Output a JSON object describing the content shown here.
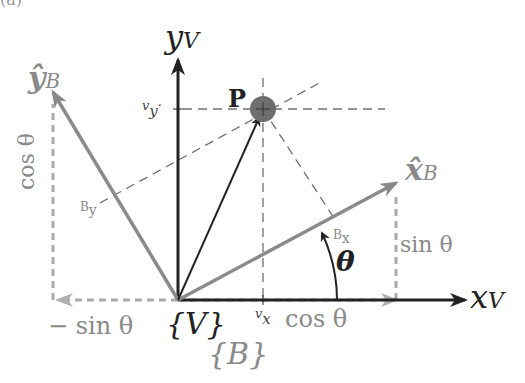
{
  "figure": {
    "panel_label": "(a)",
    "frames": {
      "world": {
        "name": "{V}",
        "x_axis": "x",
        "x_sub": "V",
        "y_axis": "y",
        "y_sub": "V"
      },
      "body": {
        "name": "{B}",
        "x_axis": "x̂",
        "x_sub": "B",
        "y_axis": "ŷ",
        "y_sub": "B"
      }
    },
    "point": {
      "label": "P"
    },
    "angle": {
      "label": "θ"
    },
    "components": {
      "vx": "v",
      "vx_sub": "x",
      "vy": "v",
      "vy_sub": "y",
      "bx": "B",
      "bx_sub": "x",
      "by": "B",
      "by_sub": "y"
    },
    "projections": {
      "sin_pos": "sin θ",
      "cos_vert": "cos θ",
      "neg_sin": "− sin θ",
      "cos_horiz": "cos θ"
    },
    "colors": {
      "world_axes": "#222222",
      "body_axes": "#8a8a8a",
      "point_fill": "#6e6e6e",
      "dashed": "#7a7a7a"
    }
  }
}
